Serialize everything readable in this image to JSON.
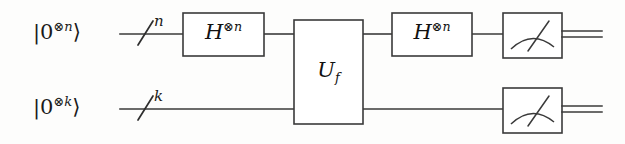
{
  "figure": {
    "kind": "quantum-circuit-diagram",
    "line_color": "#3a3a3a",
    "text_color": "#1a1a1a",
    "background": "#fdfdfc"
  },
  "registers": [
    {
      "id": "top",
      "ket_zero": "|0",
      "ket_tensor": "⊗",
      "ket_index": "n",
      "ket_close": "⟩",
      "ket_full": "|0⊗n⟩",
      "slash_label": "n",
      "wire_y": 34
    },
    {
      "id": "bottom",
      "ket_zero": "|0",
      "ket_tensor": "⊗",
      "ket_index": "k",
      "ket_close": "⟩",
      "ket_full": "|0⊗k⟩",
      "slash_label": "k",
      "wire_y": 109
    }
  ],
  "gates": [
    {
      "id": "hadamard-left",
      "symbol": "H",
      "tensor": "⊗",
      "exponent_index": "n",
      "label_full": "H⊗n",
      "register": "top"
    },
    {
      "id": "oracle",
      "symbol": "U",
      "subscript": "f",
      "label_full": "Uf",
      "register": "both"
    },
    {
      "id": "hadamard-right",
      "symbol": "H",
      "tensor": "⊗",
      "exponent_index": "n",
      "label_full": "H⊗n",
      "register": "top"
    },
    {
      "id": "measure-top",
      "symbol": "measurement-meter",
      "register": "top"
    },
    {
      "id": "measure-bottom",
      "symbol": "measurement-meter",
      "register": "bottom"
    }
  ]
}
